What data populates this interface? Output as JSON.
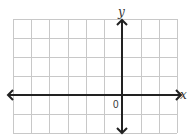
{
  "diagram": {
    "type": "coordinate-plane",
    "grid": {
      "columns": 9,
      "rows": 6,
      "left": 13,
      "top": 19,
      "right": 177,
      "bottom": 133
    },
    "axes": {
      "x_label": "x",
      "y_label": "y",
      "origin_label": "0",
      "x_axis_y": 95,
      "y_axis_x": 122
    },
    "colors": {
      "grid": "#c8c8c8",
      "axis": "#222222",
      "background": "#ffffff"
    }
  }
}
